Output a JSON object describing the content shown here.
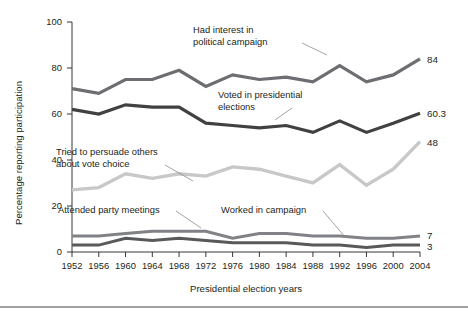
{
  "chart_data": {
    "type": "line",
    "title": "",
    "xlabel": "Presidential election years",
    "ylabel": "Percentage reporting participation",
    "categories": [
      "1952",
      "1956",
      "1960",
      "1964",
      "1968",
      "1972",
      "1976",
      "1980",
      "1984",
      "1988",
      "1992",
      "1996",
      "2000",
      "2004"
    ],
    "x": [
      1952,
      1956,
      1960,
      1964,
      1968,
      1972,
      1976,
      1980,
      1984,
      1988,
      1992,
      1996,
      2000,
      2004
    ],
    "xlim": [
      1952,
      2004
    ],
    "ylim": [
      0,
      100
    ],
    "yticks": [
      0,
      20,
      40,
      60,
      80,
      100
    ],
    "grid": false,
    "legend_position": "inline-annotations",
    "series": [
      {
        "name": "Had interest in political campaign",
        "color": "#6d6e71",
        "end_label": "84",
        "values": [
          71,
          69,
          75,
          75,
          79,
          72,
          77,
          75,
          76,
          74,
          81,
          74,
          77,
          84
        ]
      },
      {
        "name": "Voted in presidential elections",
        "color": "#414042",
        "end_label": "60.3",
        "values": [
          62,
          60,
          64,
          63,
          63,
          56,
          55,
          54,
          55,
          52,
          57,
          52,
          56,
          60.3
        ]
      },
      {
        "name": "Tried to persuade others about vote choice",
        "color": "#c7c8ca",
        "end_label": "48",
        "values": [
          27,
          28,
          34,
          32,
          34,
          33,
          37,
          36,
          33,
          30,
          38,
          29,
          36,
          48
        ]
      },
      {
        "name": "Attended party meetings",
        "color": "#808285",
        "end_label": "7",
        "values": [
          7,
          7,
          8,
          9,
          9,
          9,
          6,
          8,
          8,
          7,
          7,
          6,
          6,
          7
        ]
      },
      {
        "name": "Worked in campaign",
        "color": "#58595b",
        "end_label": "3",
        "values": [
          3,
          3,
          6,
          5,
          6,
          5,
          4,
          4,
          4,
          3,
          3,
          2,
          3,
          3
        ]
      }
    ],
    "annotations": [
      {
        "name": "had-interest-in-political-campaign",
        "line1": "Had interest in",
        "line2": "political campaign"
      },
      {
        "name": "voted-in-presidential-elections",
        "line1": "Voted in presidential",
        "line2": "elections"
      },
      {
        "name": "tried-to-persuade-others",
        "line1": "Tried to persuade others",
        "line2": "about vote choice"
      },
      {
        "name": "attended-party-meetings",
        "line1": "Attended party meetings",
        "line2": ""
      },
      {
        "name": "worked-in-campaign",
        "line1": "Worked in campaign",
        "line2": ""
      }
    ]
  }
}
